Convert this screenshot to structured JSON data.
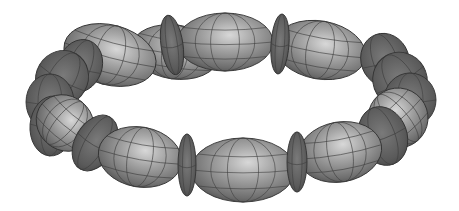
{
  "image": {
    "description": "3D rendered ring of grey ellipsoid beads alternating with thin disc spacers",
    "background": "#ffffff",
    "colors": {
      "bead_light": "#c9c9c9",
      "bead_mid": "#8a8a8a",
      "bead_dark": "#4a4a4a",
      "disc": "#5c5c5c",
      "grid": "#3e3e3e"
    }
  },
  "beads": [
    {
      "type": "big",
      "cx": 175,
      "cy": 52,
      "rx": 44,
      "ry": 27,
      "rot": 8,
      "z": 1
    },
    {
      "type": "big",
      "cx": 320,
      "cy": 50,
      "rx": 46,
      "ry": 29,
      "rot": 10,
      "z": 1
    },
    {
      "type": "big",
      "cx": 225,
      "cy": 42,
      "rx": 48,
      "ry": 29,
      "rot": 0,
      "z": 2
    },
    {
      "type": "disc",
      "cx": 172,
      "cy": 45,
      "rx": 11,
      "ry": 30,
      "rot": -8,
      "z": 3
    },
    {
      "type": "disc",
      "cx": 280,
      "cy": 44,
      "rx": 9,
      "ry": 30,
      "rot": 4,
      "z": 3
    },
    {
      "type": "big",
      "cx": 110,
      "cy": 55,
      "rx": 47,
      "ry": 30,
      "rot": 15,
      "z": 1
    },
    {
      "type": "disc",
      "cx": 80,
      "cy": 66,
      "rx": 22,
      "ry": 27,
      "rot": 20,
      "z": 1
    },
    {
      "type": "disc",
      "cx": 62,
      "cy": 78,
      "rx": 26,
      "ry": 28,
      "rot": 30,
      "z": 2
    },
    {
      "type": "disc",
      "cx": 50,
      "cy": 102,
      "rx": 24,
      "ry": 28,
      "rot": 0,
      "z": 2
    },
    {
      "type": "big",
      "cx": 65,
      "cy": 123,
      "rx": 30,
      "ry": 27,
      "rot": 40,
      "z": 3
    },
    {
      "type": "disc",
      "cx": 52,
      "cy": 126,
      "rx": 22,
      "ry": 30,
      "rot": 5,
      "z": 2
    },
    {
      "type": "disc",
      "cx": 95,
      "cy": 143,
      "rx": 20,
      "ry": 30,
      "rot": 30,
      "z": 4
    },
    {
      "type": "disc",
      "cx": 385,
      "cy": 60,
      "rx": 24,
      "ry": 27,
      "rot": -20,
      "z": 1
    },
    {
      "type": "disc",
      "cx": 400,
      "cy": 80,
      "rx": 27,
      "ry": 28,
      "rot": -30,
      "z": 2
    },
    {
      "type": "disc",
      "cx": 410,
      "cy": 100,
      "rx": 26,
      "ry": 27,
      "rot": 0,
      "z": 2
    },
    {
      "type": "big",
      "cx": 398,
      "cy": 118,
      "rx": 30,
      "ry": 30,
      "rot": -40,
      "z": 3
    },
    {
      "type": "disc",
      "cx": 383,
      "cy": 136,
      "rx": 24,
      "ry": 30,
      "rot": -20,
      "z": 4
    },
    {
      "type": "big",
      "cx": 140,
      "cy": 157,
      "rx": 42,
      "ry": 30,
      "rot": 10,
      "z": 5
    },
    {
      "type": "big",
      "cx": 340,
      "cy": 152,
      "rx": 42,
      "ry": 30,
      "rot": -10,
      "z": 5
    },
    {
      "type": "big",
      "cx": 243,
      "cy": 170,
      "rx": 52,
      "ry": 32,
      "rot": 0,
      "z": 6
    },
    {
      "type": "disc",
      "cx": 187,
      "cy": 165,
      "rx": 9,
      "ry": 31,
      "rot": 0,
      "z": 7
    },
    {
      "type": "disc",
      "cx": 297,
      "cy": 162,
      "rx": 10,
      "ry": 30,
      "rot": 0,
      "z": 7
    }
  ]
}
